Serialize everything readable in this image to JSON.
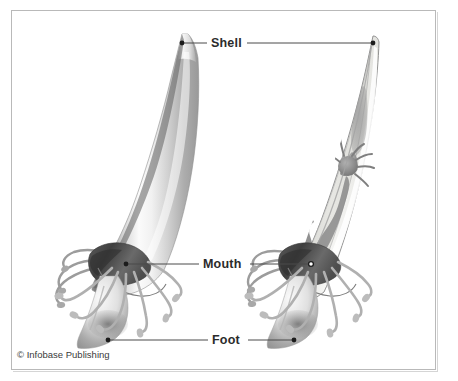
{
  "figure": {
    "background_color": "#ffffff",
    "frame_color": "#b9b9b9"
  },
  "labels": [
    {
      "id": "shell",
      "text": "Shell",
      "leader_left_point": "left shell apex",
      "leader_right_point": "right shell apex"
    },
    {
      "id": "mouth",
      "text": "Mouth",
      "leader_left_point": "left specimen mouth",
      "leader_right_point": "right specimen mouth"
    },
    {
      "id": "foot",
      "text": "Foot",
      "leader_left_point": "left specimen foot",
      "leader_right_point": "right specimen foot"
    }
  ],
  "credit": {
    "text": "© Infobase Publishing"
  },
  "specimens": [
    {
      "id": "left-specimen",
      "view": "external",
      "parts": [
        "shell",
        "captacula",
        "mouth",
        "foot"
      ]
    },
    {
      "id": "right-specimen",
      "view": "cutaway",
      "parts": [
        "shell",
        "mantle-cavity",
        "gonad",
        "digestive-gland",
        "stomach",
        "captacula",
        "mouth",
        "foot"
      ]
    }
  ],
  "palette": {
    "shell_dark": "#6e6e6e",
    "shell_mid": "#b5b5b5",
    "shell_light": "#f3f3f3",
    "organ_gray": "#8a8a8a",
    "organ_dark": "#5d5d5d",
    "cutaway_fill": "#e4e4e0",
    "leader_line": "#4a4a4a",
    "label_color": "#2b2b2b"
  }
}
